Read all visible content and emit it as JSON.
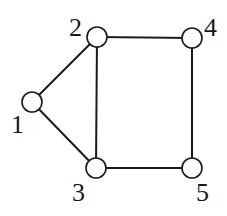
{
  "graph": {
    "nodes": [
      {
        "id": "1",
        "label": "1",
        "x": 32,
        "y": 102,
        "lx": 11,
        "ly": 133
      },
      {
        "id": "2",
        "label": "2",
        "x": 97,
        "y": 37,
        "lx": 69,
        "ly": 36
      },
      {
        "id": "3",
        "label": "3",
        "x": 96,
        "y": 168,
        "lx": 72,
        "ly": 201
      },
      {
        "id": "4",
        "label": "4",
        "x": 192,
        "y": 38,
        "lx": 204,
        "ly": 36
      },
      {
        "id": "5",
        "label": "5",
        "x": 192,
        "y": 168,
        "lx": 196,
        "ly": 201
      }
    ],
    "edges": [
      {
        "from": "1",
        "to": "2"
      },
      {
        "from": "1",
        "to": "3"
      },
      {
        "from": "2",
        "to": "3"
      },
      {
        "from": "2",
        "to": "4"
      },
      {
        "from": "3",
        "to": "5"
      },
      {
        "from": "4",
        "to": "5"
      }
    ],
    "node_radius": 10
  }
}
